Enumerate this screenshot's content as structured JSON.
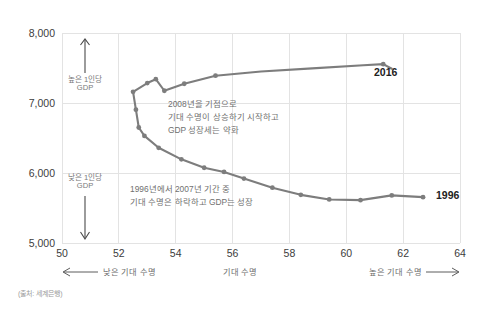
{
  "chart_data": {
    "type": "line",
    "title": "",
    "subtitle": "",
    "xlabel": "기대 수명",
    "ylabel": "1인당 GDP",
    "xlim": [
      50,
      64
    ],
    "ylim": [
      5000,
      8000
    ],
    "xticks": [
      "50",
      "52",
      "54",
      "56",
      "58",
      "60",
      "62",
      "64"
    ],
    "yticks": [
      "8,000",
      "7,000",
      "6,000",
      "5,000"
    ],
    "grid": true,
    "legend_position": "none",
    "series": [
      {
        "name": "1인당 GDP 대 기대 수명 궤적 (1996-2016)",
        "color": "#7d7d7d",
        "points": [
          {
            "year": "1996",
            "x": 62.7,
            "y": 5655
          },
          {
            "year": "1997",
            "x": 61.6,
            "y": 5680
          },
          {
            "year": "1998",
            "x": 60.5,
            "y": 5612
          },
          {
            "year": "1999",
            "x": 59.4,
            "y": 5622
          },
          {
            "year": "2000",
            "x": 58.4,
            "y": 5688
          },
          {
            "year": "2001",
            "x": 57.4,
            "y": 5790
          },
          {
            "year": "2002",
            "x": 56.4,
            "y": 5920
          },
          {
            "year": "2003",
            "x": 55.7,
            "y": 6015
          },
          {
            "year": "2004",
            "x": 55.0,
            "y": 6075
          },
          {
            "year": "2005",
            "x": 54.2,
            "y": 6195
          },
          {
            "year": "2006",
            "x": 53.4,
            "y": 6360
          },
          {
            "year": "2007",
            "x": 52.9,
            "y": 6530
          },
          {
            "year": "2008",
            "x": 52.7,
            "y": 6650
          },
          {
            "year": "2009",
            "x": 52.6,
            "y": 6905
          },
          {
            "year": "2010",
            "x": 52.5,
            "y": 7160
          },
          {
            "year": "2011",
            "x": 53.0,
            "y": 7285
          },
          {
            "year": "2012",
            "x": 53.3,
            "y": 7340
          },
          {
            "year": "2013",
            "x": 53.6,
            "y": 7175
          },
          {
            "year": "2014",
            "x": 54.3,
            "y": 7275
          },
          {
            "year": "2015",
            "x": 55.4,
            "y": 7390
          },
          {
            "year": "2016",
            "x": 61.3,
            "y": 7555
          }
        ],
        "path_points": [
          {
            "x": 62.7,
            "y": 5655
          },
          {
            "x": 61.6,
            "y": 5680
          },
          {
            "x": 60.5,
            "y": 5612
          },
          {
            "x": 59.4,
            "y": 5622
          },
          {
            "x": 58.4,
            "y": 5688
          },
          {
            "x": 57.4,
            "y": 5790
          },
          {
            "x": 56.4,
            "y": 5920
          },
          {
            "x": 55.7,
            "y": 6015
          },
          {
            "x": 55.0,
            "y": 6075
          },
          {
            "x": 54.2,
            "y": 6195
          },
          {
            "x": 53.4,
            "y": 6360
          },
          {
            "x": 52.9,
            "y": 6530
          },
          {
            "x": 52.7,
            "y": 6650
          },
          {
            "x": 52.6,
            "y": 6905
          },
          {
            "x": 52.5,
            "y": 7160
          },
          {
            "x": 53.0,
            "y": 7285
          },
          {
            "x": 53.3,
            "y": 7340
          },
          {
            "x": 53.6,
            "y": 7175
          },
          {
            "x": 54.3,
            "y": 7275
          },
          {
            "x": 55.4,
            "y": 7390
          },
          {
            "x": 57.0,
            "y": 7450
          },
          {
            "x": 58.8,
            "y": 7495
          },
          {
            "x": 60.6,
            "y": 7540
          },
          {
            "x": 61.3,
            "y": 7555
          },
          {
            "x": 61.6,
            "y": 7490
          }
        ]
      }
    ],
    "annotations": [
      {
        "id": "annotation-2008",
        "lines": [
          "2008년을 기점으로",
          "기대 수명이 상승하기 시작하고",
          "GDP 성장세는 약화"
        ]
      },
      {
        "id": "annotation-1996-2007",
        "lines": [
          "1996년에서 2007년 기간 중",
          "기대 수명은 하락하고 GDP는 성장"
        ]
      }
    ],
    "endpoint_labels": [
      {
        "id": "endpoint-2016",
        "text": "2016"
      },
      {
        "id": "endpoint-1996",
        "text": "1996"
      }
    ],
    "y_axis_direction_labels": [
      {
        "id": "high-gdp",
        "line1": "높은 1인당",
        "line2": "GDP",
        "arrow": "up"
      },
      {
        "id": "low-gdp",
        "line1": "낮은 1인당",
        "line2": "GDP",
        "arrow": "down"
      }
    ],
    "x_axis_direction_labels": [
      {
        "id": "low-life-expectancy",
        "text": "낮은 기대 수명",
        "arrow": "left"
      },
      {
        "id": "axis-center",
        "text": "기대 수명",
        "arrow": "none"
      },
      {
        "id": "high-life-expectancy",
        "text": "높은 기대 수명",
        "arrow": "right"
      }
    ],
    "source": "(출처: 세계은행)",
    "colors": {
      "line": "#7d7d7d",
      "grid": "#e3e3e3",
      "tick_text": "#3c3c3c",
      "annotation_text": "#6f6f6f",
      "endpoint_text": "#222222",
      "source_text": "#9a9a9a"
    }
  }
}
